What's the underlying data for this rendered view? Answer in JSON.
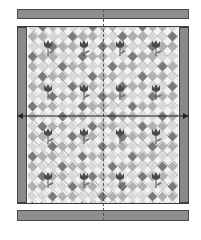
{
  "diagram": {
    "type": "quilt-layout",
    "colors": {
      "border_fill": "#8e8e8e",
      "outline": "#3a3a3a",
      "diamond_light": "#d8d8d8",
      "diamond_mid": "#b0b0b0",
      "diamond_dark": "#7a7a7a",
      "tulip": "#4a4a4a",
      "background": "#ffffff"
    },
    "parts": {
      "top_border": "top border strip",
      "bottom_border": "bottom border strip",
      "left_border": "left side border",
      "right_border": "right side border",
      "center": "quilt center",
      "measure_arrow": "width measurement arrow",
      "center_mark": "center alignment line"
    },
    "tulip_rows": 4,
    "tulip_cols": 4
  }
}
